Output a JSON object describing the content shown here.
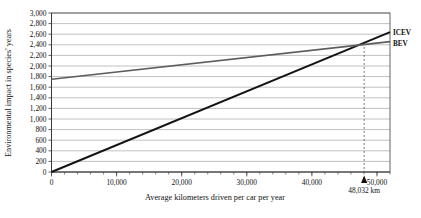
{
  "chart_data": {
    "type": "line",
    "title": "",
    "xlabel": "Average kilometers driven per car per year",
    "ylabel": "Environmental impact in species' years",
    "xlim": [
      0,
      52000
    ],
    "ylim": [
      0,
      3000
    ],
    "grid": true,
    "legend_position": "right-outside",
    "x_major_ticks": [
      0,
      10000,
      20000,
      30000,
      40000,
      50000
    ],
    "x_major_tick_labels": [
      "0",
      "10,000",
      "20,000",
      "30,000",
      "40,000",
      "50,000"
    ],
    "x_minor_tick_step": 2000,
    "y_ticks": [
      0,
      200,
      400,
      600,
      800,
      1000,
      1200,
      1400,
      1600,
      1800,
      2000,
      2200,
      2400,
      2600,
      2800,
      3000
    ],
    "y_tick_labels": [
      "0",
      "200",
      "400",
      "600",
      "800",
      "1,000",
      "1,200",
      "1,400",
      "1,600",
      "1,800",
      "2,000",
      "2,200",
      "2,400",
      "2,600",
      "2,800",
      "3,000"
    ],
    "series": [
      {
        "name": "ICEV",
        "color": "#141414",
        "x": [
          0,
          52000
        ],
        "values": [
          0,
          2640
        ]
      },
      {
        "name": "BEV",
        "color": "#5d5d5d",
        "x": [
          0,
          52000
        ],
        "values": [
          1750,
          2460
        ]
      }
    ],
    "annotations": [
      {
        "name": "crossover",
        "label": "48,032 km",
        "x": 48032,
        "y": 2438,
        "marker": "triangle-up",
        "dashed_vertical_line": true
      }
    ]
  },
  "legend": {
    "items": [
      {
        "label": "ICEV"
      },
      {
        "label": "BEV"
      }
    ]
  },
  "axis": {
    "x_title": "Average kilometers driven per car per year",
    "y_title": "Environmental impact in species' years"
  },
  "annotation": {
    "crossover_label": "48,032 km"
  }
}
